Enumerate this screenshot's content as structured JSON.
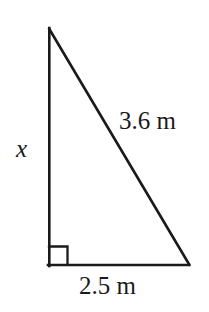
{
  "figure": {
    "type": "right-triangle-diagram",
    "background_color": "#ffffff",
    "stroke_color": "#1a1a1a",
    "text_color": "#1a1a1a",
    "stroke_width": 2.6,
    "canvas": {
      "width": 209,
      "height": 312
    },
    "vertices": {
      "apex": {
        "x": 49,
        "y": 28,
        "name": "top-vertex"
      },
      "right_angle": {
        "x": 49,
        "y": 265,
        "name": "bottom-left-vertex"
      },
      "base_end": {
        "x": 189,
        "y": 265,
        "name": "bottom-right-vertex"
      }
    },
    "right_angle_marker": {
      "name": "right-angle-square",
      "x": 49,
      "y": 246,
      "size": 18
    },
    "labels": {
      "hypotenuse": {
        "text": "3.6 m",
        "value": 3.6,
        "unit": "m",
        "side": "hypotenuse"
      },
      "base": {
        "text": "2.5 m",
        "value": 2.5,
        "unit": "m",
        "side": "base"
      },
      "vertical": {
        "text": "x",
        "value": null,
        "unit": "m",
        "side": "vertical-leg"
      }
    }
  }
}
